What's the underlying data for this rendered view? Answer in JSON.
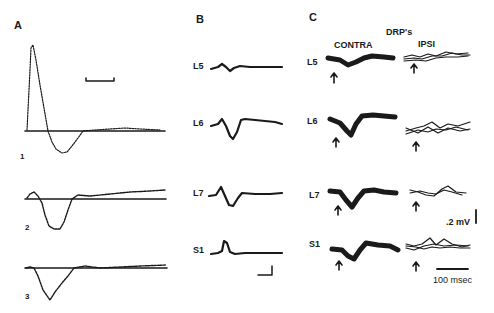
{
  "figure": {
    "panels": {
      "A": {
        "label": "A",
        "traces": [
          {
            "label": "1"
          },
          {
            "label": "2"
          },
          {
            "label": "3"
          }
        ]
      },
      "B": {
        "label": "B",
        "rows": [
          {
            "label": "L5"
          },
          {
            "label": "L6"
          },
          {
            "label": "L7"
          },
          {
            "label": "S1"
          }
        ]
      },
      "C": {
        "label": "C",
        "title": "DRP's",
        "columns": [
          {
            "label": "CONTRA"
          },
          {
            "label": "IPSI"
          }
        ],
        "rows": [
          {
            "label": "L5"
          },
          {
            "label": "L6"
          },
          {
            "label": "L7"
          },
          {
            "label": "S1"
          }
        ]
      }
    },
    "scale_bars": {
      "voltage": ".2 mV",
      "time": "100 msec"
    }
  }
}
